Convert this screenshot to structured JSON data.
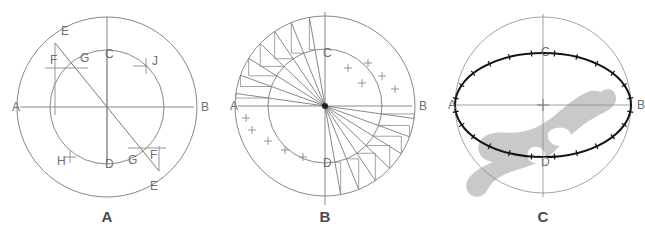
{
  "figure": {
    "background": "#ffffff",
    "line_color": "#777777",
    "bold_line_color": "#1a1a1a",
    "label_color": "#6e6e6e",
    "caption_color": "#4a4a4a",
    "overlay_color": "#c9c9c9",
    "width": 645,
    "height": 235
  },
  "panels": [
    {
      "id": "panel-a",
      "caption": "A",
      "caption_x": 107,
      "caption_y": 222,
      "center": {
        "x": 107,
        "y": 107
      },
      "outer_radius": 90,
      "inner_radius": 57,
      "axis_labels": [
        {
          "name": "A",
          "text": "A",
          "x": 12,
          "y": 111
        },
        {
          "name": "B",
          "text": "B",
          "x": 201,
          "y": 111
        },
        {
          "name": "C",
          "text": "C",
          "x": 105,
          "y": 58
        },
        {
          "name": "D",
          "text": "D",
          "x": 105,
          "y": 168
        }
      ],
      "construction_labels": [
        {
          "name": "E-top",
          "text": "E",
          "x": 61,
          "y": 35
        },
        {
          "name": "F-top",
          "text": "F",
          "x": 50,
          "y": 64
        },
        {
          "name": "G-top",
          "text": "G",
          "x": 80,
          "y": 62
        },
        {
          "name": "J",
          "text": "J",
          "x": 152,
          "y": 65
        },
        {
          "name": "H",
          "text": "H",
          "x": 57,
          "y": 165
        },
        {
          "name": "G-bottom",
          "text": "G",
          "x": 128,
          "y": 164
        },
        {
          "name": "F-bottom",
          "text": "F",
          "x": 150,
          "y": 159
        },
        {
          "name": "E-bottom",
          "text": "E",
          "x": 150,
          "y": 190
        }
      ],
      "chord_angle_deg": 55,
      "tick_marks": [
        {
          "name": "tick-J",
          "x": 140,
          "y": 64
        },
        {
          "name": "tick-H",
          "x": 70,
          "y": 157
        }
      ]
    },
    {
      "id": "panel-b",
      "caption": "B",
      "caption_x": 325,
      "caption_y": 222,
      "center": {
        "x": 325,
        "y": 106
      },
      "outer_radius": 90,
      "inner_radius": 57,
      "axis_labels": [
        {
          "name": "A",
          "text": "A",
          "x": 230,
          "y": 110
        },
        {
          "name": "B",
          "text": "B",
          "x": 419,
          "y": 110
        },
        {
          "name": "C",
          "text": "C",
          "x": 323,
          "y": 57
        },
        {
          "name": "D",
          "text": "D",
          "x": 323,
          "y": 167
        }
      ],
      "ray_angles_deg": [
        100,
        112,
        124,
        136,
        148,
        160,
        172
      ],
      "mirror_ray_angles_deg": [
        280,
        292,
        304,
        316,
        328,
        340,
        352
      ],
      "cross_marks": [
        {
          "name": "cross-ur-1",
          "x": 348,
          "y": 68
        },
        {
          "name": "cross-ur-2",
          "x": 368,
          "y": 63
        },
        {
          "name": "cross-ur-3",
          "x": 382,
          "y": 76
        },
        {
          "name": "cross-ur-4",
          "x": 395,
          "y": 89
        },
        {
          "name": "cross-ur-5",
          "x": 362,
          "y": 83
        },
        {
          "name": "cross-ll-1",
          "x": 252,
          "y": 130
        },
        {
          "name": "cross-ll-2",
          "x": 268,
          "y": 141
        },
        {
          "name": "cross-ll-3",
          "x": 285,
          "y": 150
        },
        {
          "name": "cross-ll-4",
          "x": 303,
          "y": 157
        },
        {
          "name": "cross-ll-5",
          "x": 246,
          "y": 118
        }
      ]
    },
    {
      "id": "panel-c",
      "caption": "C",
      "caption_x": 543,
      "caption_y": 222,
      "center": {
        "x": 543,
        "y": 105
      },
      "circle_radius": 88,
      "ellipse_rx": 88,
      "ellipse_ry": 52,
      "axis_labels": [
        {
          "name": "A",
          "text": "A",
          "x": 448,
          "y": 109
        },
        {
          "name": "B",
          "text": "B",
          "x": 637,
          "y": 109
        },
        {
          "name": "C",
          "text": "C",
          "x": 541,
          "y": 56
        },
        {
          "name": "D",
          "text": "D",
          "x": 541,
          "y": 166
        }
      ],
      "ellipse_tick_count": 24,
      "ellipse_tick_length": 6,
      "overlay_name": "bone-silhouette-overlay"
    }
  ]
}
